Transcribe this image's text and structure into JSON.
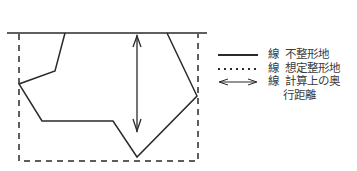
{
  "diagram": {
    "colors": {
      "line": "#2a2a2a",
      "background": "#ffffff"
    },
    "road_line": {
      "x1": 7,
      "y1": 33,
      "x2": 207,
      "y2": 33
    },
    "irregular_land_polygon": "65,33 55,71 19,84 42,121 113,121 137,157 197,96 167,33",
    "assumed_rect": {
      "x": 19,
      "y": 33,
      "width": 179,
      "height": 128
    },
    "depth_arrow": {
      "x": 137,
      "y1": 35,
      "y2": 132
    }
  },
  "legend": {
    "items": [
      {
        "style": "solid",
        "kind": "線",
        "label": "不整形地"
      },
      {
        "style": "dotted",
        "kind": "線",
        "label": "想定整形地"
      },
      {
        "style": "arrow",
        "kind": "線",
        "label": "計算上の奥",
        "label_cont": "行距離"
      }
    ]
  }
}
